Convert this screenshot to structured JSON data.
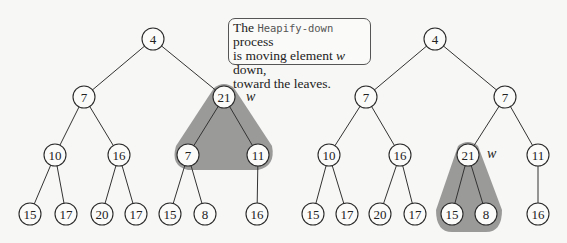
{
  "callout": {
    "prefix": "The ",
    "code": "Heapify-down",
    "line1_suffix": " process",
    "line2_prefix": "is moving element ",
    "var": "w",
    "line2_suffix": " down,",
    "line3": "toward the leaves."
  },
  "trees": [
    {
      "name": "before",
      "highlight_label": "w",
      "nodes": [
        {
          "id": "a",
          "value": "4",
          "x": 153,
          "y": 39
        },
        {
          "id": "b",
          "value": "7",
          "x": 84,
          "y": 97
        },
        {
          "id": "c",
          "value": "21",
          "x": 224,
          "y": 97
        },
        {
          "id": "d",
          "value": "10",
          "x": 55,
          "y": 155
        },
        {
          "id": "e",
          "value": "16",
          "x": 119,
          "y": 155
        },
        {
          "id": "f",
          "value": "7",
          "x": 188,
          "y": 155
        },
        {
          "id": "g",
          "value": "11",
          "x": 258,
          "y": 155
        },
        {
          "id": "h",
          "value": "15",
          "x": 30,
          "y": 214
        },
        {
          "id": "i",
          "value": "17",
          "x": 66,
          "y": 214
        },
        {
          "id": "j",
          "value": "20",
          "x": 102,
          "y": 214
        },
        {
          "id": "k",
          "value": "17",
          "x": 136,
          "y": 214
        },
        {
          "id": "l",
          "value": "15",
          "x": 170,
          "y": 214
        },
        {
          "id": "m",
          "value": "8",
          "x": 205,
          "y": 214
        },
        {
          "id": "n",
          "value": "16",
          "x": 257,
          "y": 214
        }
      ],
      "edges": [
        [
          "a",
          "b"
        ],
        [
          "a",
          "c"
        ],
        [
          "b",
          "d"
        ],
        [
          "b",
          "e"
        ],
        [
          "c",
          "f"
        ],
        [
          "c",
          "g"
        ],
        [
          "d",
          "h"
        ],
        [
          "d",
          "i"
        ],
        [
          "e",
          "j"
        ],
        [
          "e",
          "k"
        ],
        [
          "f",
          "l"
        ],
        [
          "f",
          "m"
        ],
        [
          "g",
          "n"
        ]
      ]
    },
    {
      "name": "after",
      "highlight_label": "w",
      "nodes": [
        {
          "id": "a",
          "value": "4",
          "x": 435,
          "y": 39
        },
        {
          "id": "b",
          "value": "7",
          "x": 366,
          "y": 97
        },
        {
          "id": "c",
          "value": "7",
          "x": 505,
          "y": 97
        },
        {
          "id": "d",
          "value": "10",
          "x": 329,
          "y": 155
        },
        {
          "id": "e",
          "value": "16",
          "x": 400,
          "y": 155
        },
        {
          "id": "f",
          "value": "21",
          "x": 468,
          "y": 155
        },
        {
          "id": "g",
          "value": "11",
          "x": 538,
          "y": 155
        },
        {
          "id": "h",
          "value": "15",
          "x": 313,
          "y": 214
        },
        {
          "id": "i",
          "value": "17",
          "x": 347,
          "y": 214
        },
        {
          "id": "j",
          "value": "20",
          "x": 380,
          "y": 214
        },
        {
          "id": "k",
          "value": "17",
          "x": 415,
          "y": 214
        },
        {
          "id": "l",
          "value": "15",
          "x": 452,
          "y": 214
        },
        {
          "id": "m",
          "value": "8",
          "x": 486,
          "y": 214
        },
        {
          "id": "n",
          "value": "16",
          "x": 538,
          "y": 214
        }
      ],
      "edges": [
        [
          "a",
          "b"
        ],
        [
          "a",
          "c"
        ],
        [
          "b",
          "d"
        ],
        [
          "b",
          "e"
        ],
        [
          "c",
          "f"
        ],
        [
          "c",
          "g"
        ],
        [
          "d",
          "h"
        ],
        [
          "d",
          "i"
        ],
        [
          "e",
          "j"
        ],
        [
          "e",
          "k"
        ],
        [
          "f",
          "l"
        ],
        [
          "f",
          "m"
        ],
        [
          "g",
          "n"
        ]
      ]
    }
  ],
  "colors": {
    "shade": "#8f8f8f",
    "stroke": "#2a2a2a",
    "background": "#f7f7f5"
  }
}
